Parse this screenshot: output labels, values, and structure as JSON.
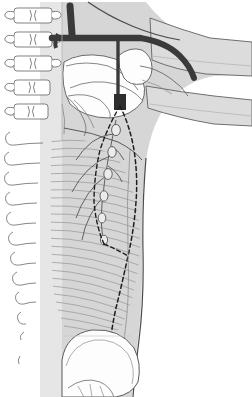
{
  "figure": {
    "domain_note": "line-art medical illustration, no visible text labels",
    "width": 252,
    "height": 397,
    "background_color": "#ffffff"
  },
  "palette": {
    "background": "#ffffff",
    "body_fill": "#d6d6d6",
    "body_fill_light": "#e4e4e4",
    "body_fill_shadow": "#c4c4c4",
    "bone_fill": "#fdfdfd",
    "bone_outline": "#5a5a5a",
    "outline": "#4a4a4a",
    "outline_soft": "#8f8f8f",
    "vessel_dark": "#3a3a3a",
    "vessel_thin": "#555555",
    "muscle_hatch": "#9a9a9a",
    "dashed_line": "#1e1e1e",
    "spine_outline": "#6b6b6b"
  },
  "structures": {
    "spine": {
      "name": "vertebral-column",
      "label": "Thoracic vertebrae with transverse processes",
      "vertebra_count": 8,
      "rib_count": 9,
      "x_range": [
        4,
        62
      ],
      "y_range": [
        2,
        360
      ]
    },
    "clavicle_vessel": {
      "name": "subclavian-vessel",
      "label": "Subclavian / axillary vessel",
      "color": "#3a3a3a",
      "stroke_width": 7
    },
    "scapula": {
      "name": "scapula-humerus-group",
      "label": "Scapula, humeral head and ribs",
      "fill": "#fdfdfd"
    },
    "arm": {
      "name": "upper-arm",
      "label": "Upper arm extending laterally",
      "fill": "#d6d6d6"
    },
    "muscle_hatching": {
      "name": "serratus-hatching",
      "label": "Hatched chest wall musculature",
      "line_count": 34,
      "color": "#9a9a9a"
    },
    "lymphatics": {
      "name": "axillary-lymphatic-chain",
      "label": "Axillary lymph node chain and tributaries",
      "node_count": 6,
      "color": "#555555"
    },
    "dashed_boundary": {
      "name": "axillary-dashed-boundary",
      "label": "Dashed resection / dissection boundary line",
      "color": "#1e1e1e",
      "dash_pattern": "4 3"
    },
    "breast": {
      "name": "breast-contour",
      "label": "Breast and lower chest contour",
      "fill": "#fdfdfd"
    }
  }
}
